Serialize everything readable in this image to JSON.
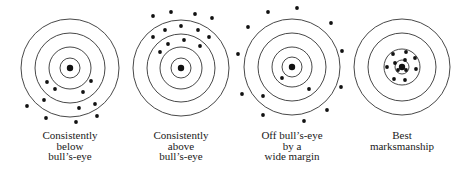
{
  "style": {
    "ring_color": "#333333",
    "dot_color": "#111111",
    "background": "#ffffff"
  },
  "targets": [
    {
      "id": "below",
      "center": [
        70,
        68
      ],
      "rings": [
        49,
        35,
        21,
        10
      ],
      "bullseye_r": 3.2,
      "dots": [
        [
          47,
          82
        ],
        [
          91,
          81
        ],
        [
          55,
          89
        ],
        [
          83,
          92
        ],
        [
          44,
          100
        ],
        [
          27,
          106
        ],
        [
          79,
          108
        ],
        [
          95,
          104
        ],
        [
          46,
          118
        ],
        [
          97,
          116
        ],
        [
          76,
          122
        ]
      ],
      "label_lines": [
        "Consistently",
        "below",
        "bull’s-eye"
      ],
      "label_top": 130
    },
    {
      "id": "above",
      "center": [
        181,
        68
      ],
      "rings": [
        48,
        34,
        21,
        10
      ],
      "bullseye_r": 3.2,
      "dots": [
        [
          153,
          16
        ],
        [
          171,
          12
        ],
        [
          195,
          14
        ],
        [
          212,
          18
        ],
        [
          165,
          30
        ],
        [
          181,
          26
        ],
        [
          198,
          30
        ],
        [
          153,
          37
        ],
        [
          209,
          37
        ],
        [
          168,
          44
        ],
        [
          184,
          40
        ],
        [
          200,
          46
        ],
        [
          160,
          52
        ]
      ],
      "label_lines": [
        "Consistently",
        "above",
        "bull’s-eye"
      ],
      "label_top": 130
    },
    {
      "id": "wide-margin",
      "center": [
        292,
        67
      ],
      "rings": [
        48,
        34,
        20,
        10
      ],
      "bullseye_r": 3.2,
      "dots": [
        [
          268,
          12
        ],
        [
          297,
          8
        ],
        [
          248,
          27
        ],
        [
          331,
          23
        ],
        [
          238,
          54
        ],
        [
          342,
          51
        ],
        [
          282,
          78
        ],
        [
          309,
          89
        ],
        [
          341,
          87
        ],
        [
          242,
          94
        ],
        [
          263,
          96
        ],
        [
          327,
          110
        ],
        [
          263,
          115
        ],
        [
          304,
          121
        ]
      ],
      "label_lines": [
        "Off bull’s-eye",
        "by a",
        "wide margin"
      ],
      "label_top": 130
    },
    {
      "id": "best",
      "center": [
        402,
        67
      ],
      "rings": [
        48,
        34,
        18,
        7
      ],
      "bullseye_r": 3.2,
      "dots": [
        [
          393,
          54
        ],
        [
          406,
          52
        ],
        [
          415,
          58
        ],
        [
          395,
          63
        ],
        [
          405,
          60
        ],
        [
          387,
          67
        ],
        [
          398,
          70
        ],
        [
          406,
          70
        ],
        [
          416,
          69
        ],
        [
          394,
          79
        ],
        [
          405,
          80
        ]
      ],
      "label_lines": [
        "Best",
        "marksmanship"
      ],
      "label_top": 130
    }
  ]
}
